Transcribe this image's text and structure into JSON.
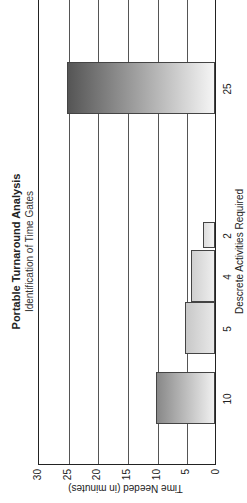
{
  "chart_data": {
    "type": "bar",
    "title": "Portable Turnaround Analysis",
    "subtitle": "Identification of Time Gates",
    "xlabel": "Descrete Activities Required",
    "ylabel": "Time Needed (in minutes)",
    "categories": [
      "10",
      "5",
      "4",
      "2",
      "25"
    ],
    "values": [
      10,
      5,
      4,
      2,
      25
    ],
    "ylim": [
      0,
      30
    ],
    "yticks": [
      "0",
      "5",
      "10",
      "15",
      "20",
      "25",
      "30"
    ],
    "grid": true,
    "rotated": "image rotated 90 degrees counter-clockwise"
  }
}
